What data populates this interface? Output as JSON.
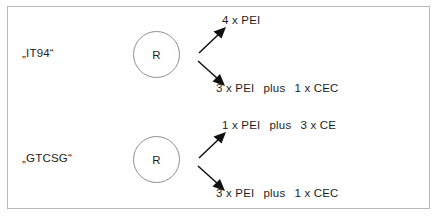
{
  "figure": {
    "background_color": "#ffffff",
    "frame_color": "#b9b9b9",
    "text_color": "#1d1d1d",
    "circle_stroke_color": "#8f8f8f"
  },
  "rows": [
    {
      "label": "„IT94“",
      "node_letter": "R",
      "up_arrow_icon": "arrow-up-right-icon",
      "down_arrow_icon": "arrow-down-right-icon",
      "product_top": {
        "full": "4 x PEI",
        "left": "4 x PEI",
        "connector": "",
        "right": ""
      },
      "product_bottom": {
        "full": "3 x PEI   plus   1 x CEC",
        "left": "3 x PEI",
        "connector": "plus",
        "right": "1 x CEC"
      }
    },
    {
      "label": "„GTCSG“",
      "node_letter": "R",
      "up_arrow_icon": "arrow-up-right-icon",
      "down_arrow_icon": "arrow-down-right-icon",
      "product_top": {
        "full": "1 x PEI   plus   3 x CE",
        "left": "1 x PEI",
        "connector": "plus",
        "right": "3 x CE"
      },
      "product_bottom": {
        "full": "3 x PEI   plus   1 x CEC",
        "left": "3 x PEI",
        "connector": "plus",
        "right": "1 x CEC"
      }
    }
  ]
}
